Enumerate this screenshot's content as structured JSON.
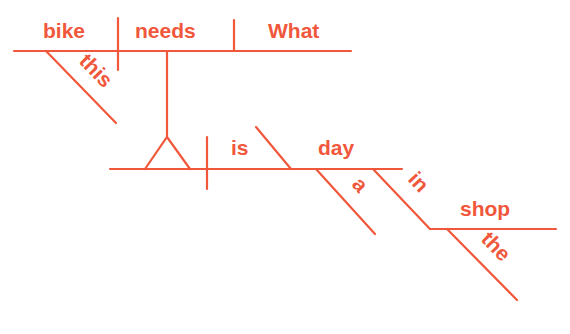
{
  "diagram": {
    "type": "sentence-diagram",
    "color": "#f0573b",
    "background": "#ffffff",
    "sentence": "What this bike needs is a day in the shop",
    "main_clause": {
      "subject": "bike",
      "verb": "needs",
      "direct_object": "What",
      "subject_modifiers": [
        "this"
      ]
    },
    "noun_clause": {
      "subject_placeholder": "(clause as subject)",
      "verb": "is",
      "predicate_nominative": "day",
      "modifiers": {
        "day": [
          "a"
        ]
      },
      "prepositional_phrase": {
        "preposition": "in",
        "object": "shop",
        "object_modifiers": [
          "the"
        ]
      }
    },
    "words": {
      "bike": "bike",
      "needs": "needs",
      "what": "What",
      "this": "this",
      "is": "is",
      "day": "day",
      "a": "a",
      "in": "in",
      "shop": "shop",
      "the": "the"
    }
  }
}
